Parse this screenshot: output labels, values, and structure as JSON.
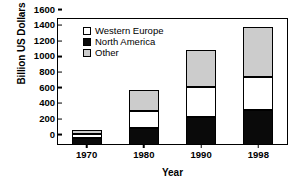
{
  "chart_data": {
    "type": "bar",
    "stacked": true,
    "title": "",
    "xlabel": "Year",
    "ylabel": "Billion US Dollars",
    "categories": [
      "1970",
      "1980",
      "1990",
      "1998"
    ],
    "ylim": [
      0,
      1600
    ],
    "yticks": [
      0,
      200,
      400,
      600,
      800,
      1000,
      1200,
      1400,
      1600
    ],
    "ytick_labels": [
      "0",
      "200",
      "400",
      "600",
      "800",
      "1000",
      "1200",
      "1400",
      "1600"
    ],
    "grid": false,
    "legend_position": "top-left",
    "series": [
      {
        "name": "North America",
        "color": "#0a0a0a",
        "values": [
          80,
          200,
          350,
          440
        ]
      },
      {
        "name": "Western Europe",
        "color": "#ffffff",
        "values": [
          45,
          220,
          380,
          420
        ]
      },
      {
        "name": "Other",
        "color": "#cccccc",
        "values": [
          50,
          275,
          470,
          640
        ]
      }
    ],
    "totals": [
      175,
      695,
      1200,
      1500
    ]
  },
  "legend": {
    "items": [
      {
        "label": "Western Europe",
        "swatch": "swatch-west"
      },
      {
        "label": "North America",
        "swatch": "swatch-north"
      },
      {
        "label": "Other",
        "swatch": "swatch-other"
      }
    ]
  }
}
